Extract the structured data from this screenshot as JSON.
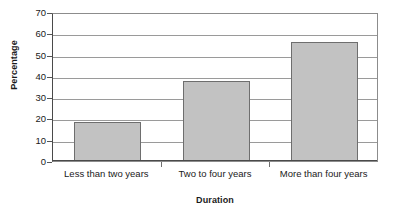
{
  "chart_data": {
    "type": "bar",
    "title": "",
    "subtitle": "",
    "categories": [
      "Less than two years",
      "Two to four years",
      "More than four years"
    ],
    "values": [
      18.5,
      37.5,
      56
    ],
    "xlabel": "Duration",
    "ylabel": "Percentage",
    "ylim": [
      0,
      70
    ],
    "yticks": [
      0,
      10,
      20,
      30,
      40,
      50,
      60,
      70
    ],
    "ytick_labels": [
      "0",
      "10",
      "20",
      "30",
      "40",
      "50",
      "60",
      "70"
    ],
    "grid": "horizontal",
    "legend": "none",
    "series": [
      {
        "name": "Percentage",
        "values": [
          18.5,
          37.5,
          56
        ]
      }
    ],
    "colors": {
      "bar_fill": "#c2c2c2",
      "bar_border": "#6e6e6e",
      "gridline": "#9a9a9a",
      "axis": "#4a4a4a",
      "text": "#1a1a1a",
      "background": "#ffffff"
    }
  }
}
